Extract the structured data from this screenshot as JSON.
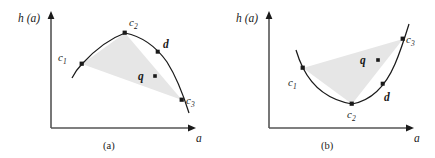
{
  "figure": {
    "background": "#ffffff",
    "ink_color": "#1a1a1a",
    "shade_color": "#e6e6e6",
    "panels": [
      {
        "id": "a",
        "caption": "(a)",
        "axes": {
          "ylabel": "h (a)",
          "xlabel": "a",
          "origin": [
            51,
            128
          ],
          "x_end": [
            196,
            128
          ],
          "y_top": [
            51,
            12
          ]
        },
        "curve": {
          "shape": "concave-down-parabola",
          "description": "downward opening arc through c1, c2, d, c3"
        },
        "points": [
          {
            "name": "c1",
            "label": "c",
            "subscript": "1",
            "x": 82,
            "y": 64,
            "label_x": 58,
            "label_y": 52
          },
          {
            "name": "c2",
            "label": "c",
            "subscript": "2",
            "x": 125,
            "y": 33,
            "label_x": 129,
            "label_y": 17
          },
          {
            "name": "c3",
            "label": "c",
            "subscript": "3",
            "x": 182,
            "y": 100,
            "label_x": 186,
            "label_y": 95
          },
          {
            "name": "d",
            "label": "d",
            "subscript": "",
            "x": 158,
            "y": 52,
            "label_x": 163,
            "label_y": 39
          },
          {
            "name": "q",
            "label": "q",
            "subscript": "",
            "x": 155,
            "y": 76,
            "label_x": 138,
            "label_y": 71
          }
        ],
        "shaded_region": {
          "type": "triangle",
          "vertices": [
            [
              82,
              64
            ],
            [
              125,
              33
            ],
            [
              182,
              100
            ]
          ]
        }
      },
      {
        "id": "b",
        "caption": "(b)",
        "axes": {
          "ylabel": "h (a)",
          "xlabel": "a",
          "origin": [
            269,
            128
          ],
          "x_end": [
            414,
            128
          ],
          "y_top": [
            269,
            12
          ]
        },
        "curve": {
          "shape": "concave-up-parabola",
          "description": "upward opening arc through c1, c2, d, c3"
        },
        "points": [
          {
            "name": "c1",
            "label": "c",
            "subscript": "1",
            "x": 303,
            "y": 68,
            "label_x": 288,
            "label_y": 77
          },
          {
            "name": "c2",
            "label": "c",
            "subscript": "2",
            "x": 352,
            "y": 104,
            "label_x": 347,
            "label_y": 109
          },
          {
            "name": "c3",
            "label": "c",
            "subscript": "3",
            "x": 403,
            "y": 39,
            "label_x": 406,
            "label_y": 34
          },
          {
            "name": "d",
            "label": "d",
            "subscript": "",
            "x": 383,
            "y": 84,
            "label_x": 384,
            "label_y": 92
          },
          {
            "name": "q",
            "label": "q",
            "subscript": "",
            "x": 378,
            "y": 60,
            "label_x": 360,
            "label_y": 55
          }
        ],
        "shaded_region": {
          "type": "triangle",
          "vertices": [
            [
              303,
              68
            ],
            [
              352,
              104
            ],
            [
              403,
              39
            ]
          ]
        }
      }
    ]
  }
}
